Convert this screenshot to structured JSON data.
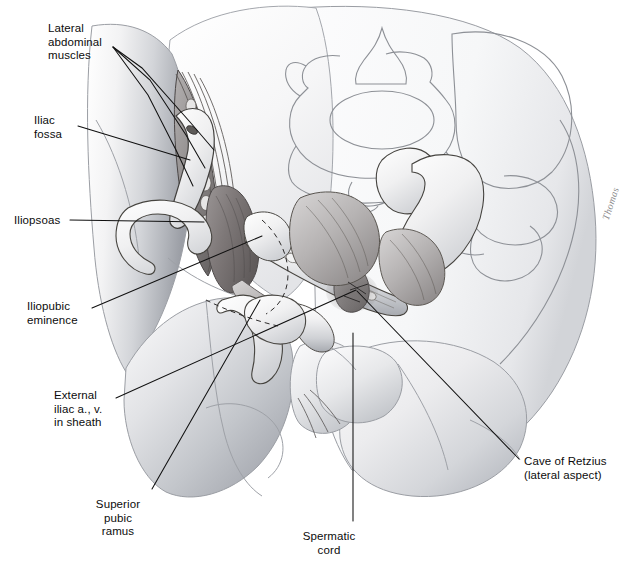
{
  "figure": {
    "kind": "anatomical-illustration",
    "background_color": "#ffffff",
    "ink_color": "#1a1a1a",
    "leader_color": "#101010",
    "ghost_outline_color": "#8d9096",
    "signature": "Thomas"
  },
  "labels": [
    {
      "id": "lateral-abdominal-muscles",
      "text": "Lateral\nabdominal\nmuscles",
      "x": 48,
      "y": 22,
      "align": "left"
    },
    {
      "id": "iliac-fossa",
      "text": "Iliac\nfossa",
      "x": 34,
      "y": 114,
      "align": "left"
    },
    {
      "id": "iliopsoas",
      "text": "Iliopsoas",
      "x": 14,
      "y": 214,
      "align": "left"
    },
    {
      "id": "iliopubic-eminence",
      "text": "Iliopubic\neminence",
      "x": 27,
      "y": 300,
      "align": "left"
    },
    {
      "id": "external-iliac-vessels",
      "text": "External\niliac a., v.\nin sheath",
      "x": 54,
      "y": 389,
      "align": "left"
    },
    {
      "id": "superior-pubic-ramus",
      "text": "Superior\npubic\nramus",
      "x": 118,
      "y": 498,
      "align": "center"
    },
    {
      "id": "spermatic-cord",
      "text": "Spermatic\ncord",
      "x": 329,
      "y": 530,
      "align": "center"
    },
    {
      "id": "cave-of-retzius",
      "text": "Cave of Retzius\n(lateral aspect)",
      "x": 524,
      "y": 455,
      "align": "left"
    }
  ],
  "leader_lines": [
    {
      "id": "leader-lateral-abdominal-1",
      "points": "113,47 142,68 190,122 214,150"
    },
    {
      "id": "leader-lateral-abdominal-2",
      "points": "113,47 150,80 186,135 205,168"
    },
    {
      "id": "leader-lateral-abdominal-3",
      "points": "113,47 148,95 176,150 193,186"
    },
    {
      "id": "leader-iliac-fossa",
      "points": "78,126 190,160"
    },
    {
      "id": "leader-iliopsoas",
      "points": "70,220 204,222"
    },
    {
      "id": "leader-iliopubic-eminence",
      "points": "92,308 262,236"
    },
    {
      "id": "leader-external-iliac",
      "points": "116,398 356,290"
    },
    {
      "id": "leader-superior-pubic-ramus",
      "points": "152,489 260,300"
    },
    {
      "id": "leader-spermatic-cord",
      "points": "353,521 353,333"
    },
    {
      "id": "leader-cave-of-retzius",
      "points": "519,459 357,291"
    }
  ]
}
